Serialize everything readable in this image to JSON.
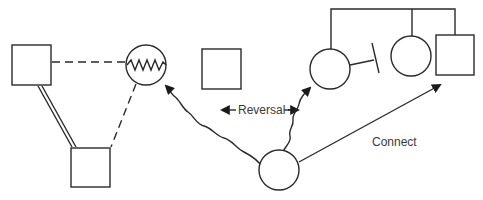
{
  "diagram": {
    "type": "family-relationship-diagram",
    "labels": {
      "reversal": "Reversal",
      "connect": "Connect"
    },
    "left_triangle": {
      "nodes": [
        {
          "id": "male-top-left",
          "shape": "square"
        },
        {
          "id": "female-conflict",
          "shape": "circle",
          "marking": "zigzag-conflict"
        },
        {
          "id": "male-bottom",
          "shape": "square"
        }
      ],
      "edges": [
        {
          "from": "male-top-left",
          "to": "female-conflict",
          "style": "dashed"
        },
        {
          "from": "male-top-left",
          "to": "male-bottom",
          "style": "double-line"
        },
        {
          "from": "female-conflict",
          "to": "male-bottom",
          "style": "dashed"
        }
      ]
    },
    "middle": {
      "nodes": [
        {
          "id": "isolated-male",
          "shape": "square"
        },
        {
          "id": "center-female",
          "shape": "circle"
        }
      ]
    },
    "right_family": {
      "nodes": [
        {
          "id": "sibling-female-left",
          "shape": "circle",
          "marking": "cutoff"
        },
        {
          "id": "sibling-female-middle",
          "shape": "circle"
        },
        {
          "id": "sibling-male-right",
          "shape": "square"
        }
      ],
      "edges": [
        {
          "type": "sibship-bar"
        }
      ]
    },
    "arrows": [
      {
        "from": "center-female",
        "to": "female-conflict",
        "style": "wavy",
        "label": "Reversal"
      },
      {
        "from": "center-female",
        "to": "sibling-female-left",
        "style": "wavy",
        "label": "Reversal"
      },
      {
        "from": "center-female",
        "to": "sibling-male-right",
        "style": "straight",
        "label": "Connect"
      }
    ]
  }
}
